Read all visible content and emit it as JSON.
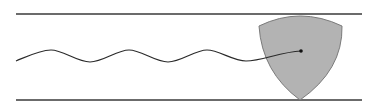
{
  "diagram": {
    "colors": {
      "line": "#3a3a3a",
      "shape_fill": "#b3b3b3",
      "shape_stroke": "#7a7a7a",
      "curve": "#2a2a2a",
      "dot": "#111111",
      "background": "#ffffff"
    },
    "elements": {
      "top_line": "upper boundary line",
      "bottom_line": "lower boundary line",
      "shape": "reuleaux-triangle",
      "path": "wavy traced center path",
      "center": "center point"
    }
  }
}
